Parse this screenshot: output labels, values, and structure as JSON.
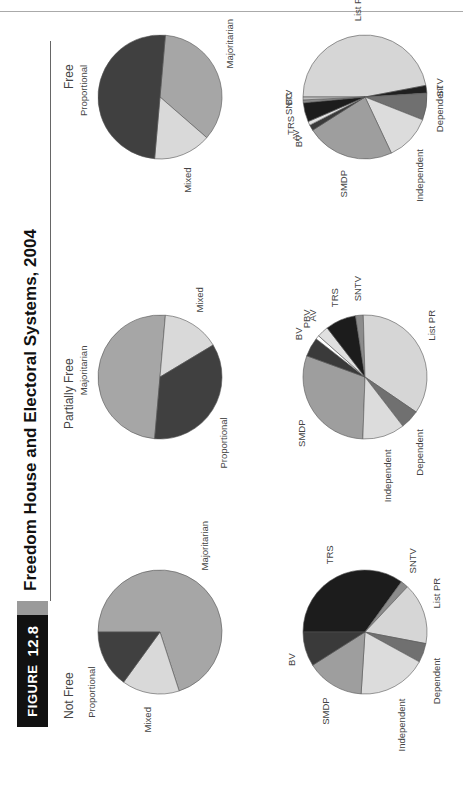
{
  "figure": {
    "label": "Figure",
    "number": "12.8",
    "title": "Freedom House and Electoral Systems, 2004"
  },
  "columns": [
    "Not Free",
    "Partially Free",
    "Free"
  ],
  "colors": {
    "Majoritarian": "#a6a6a6",
    "Mixed": "#d9d9d9",
    "Proportional": "#404040",
    "TRS": "#1c1c1c",
    "SNTV": "#8c8c8c",
    "List PR": "#d6d6d6",
    "Dependent": "#707070",
    "Independent": "#dcdcdc",
    "SMDP": "#9e9e9e",
    "BV": "#3a3a3a",
    "PBV": "#ffffff",
    "AV": "#e0e0e0",
    "STV": "#202020",
    "BC": "#bdbdbd"
  },
  "chart_data": [
    {
      "type": "pie",
      "title": "Not Free",
      "row": "summary",
      "categories": [
        "Majoritarian",
        "Mixed",
        "Proportional"
      ],
      "values": [
        70,
        15,
        15
      ]
    },
    {
      "type": "pie",
      "title": "Partially Free",
      "row": "summary",
      "categories": [
        "Majoritarian",
        "Mixed",
        "Proportional"
      ],
      "values": [
        50,
        15,
        35
      ]
    },
    {
      "type": "pie",
      "title": "Free",
      "row": "summary",
      "categories": [
        "Majoritarian",
        "Mixed",
        "Proportional"
      ],
      "values": [
        35,
        15,
        50
      ]
    },
    {
      "type": "pie",
      "title": "Not Free",
      "row": "detail",
      "categories": [
        "TRS",
        "SNTV",
        "List PR",
        "Dependent",
        "Independent",
        "SMDP",
        "BV"
      ],
      "values": [
        35,
        2,
        16,
        5,
        18,
        15,
        9
      ]
    },
    {
      "type": "pie",
      "title": "Partially Free",
      "row": "detail",
      "categories": [
        "SMDP",
        "BV",
        "PBV",
        "AV",
        "TRS",
        "SNTV",
        "List PR",
        "Dependent",
        "Independent"
      ],
      "values": [
        30,
        5,
        1,
        3,
        8,
        2,
        35,
        5,
        11
      ]
    },
    {
      "type": "pie",
      "title": "Free",
      "row": "detail",
      "categories": [
        "List PR",
        "STV",
        "Dependent",
        "Independent",
        "SMDP",
        "BV",
        "AV",
        "TRS",
        "SNTV",
        "BC"
      ],
      "values": [
        47,
        2,
        7,
        12,
        23,
        1.5,
        1,
        5,
        0.75,
        0.75
      ]
    }
  ]
}
